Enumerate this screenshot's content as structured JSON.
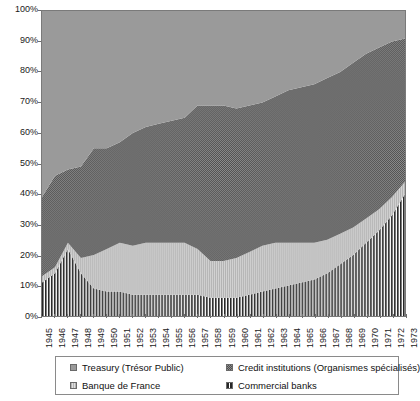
{
  "chart_data": {
    "type": "area",
    "title": "",
    "xlabel": "",
    "ylabel": "",
    "ylim": [
      0,
      100
    ],
    "ytick_labels": [
      "0%",
      "10%",
      "20%",
      "30%",
      "40%",
      "50%",
      "60%",
      "70%",
      "80%",
      "90%",
      "100%"
    ],
    "ytick_values": [
      0,
      10,
      20,
      30,
      40,
      50,
      60,
      70,
      80,
      90,
      100
    ],
    "grid": false,
    "legend_position": "bottom",
    "stacked": true,
    "stack_order_bottom_to_top": [
      "Commercial banks",
      "Banque de France",
      "Credit institutions (Organismes spécialisés)",
      "Treasury (Trésor Public)"
    ],
    "categories": [
      "1945",
      "1946",
      "1947",
      "1948",
      "1949",
      "1950",
      "1951",
      "1952",
      "1953",
      "1954",
      "1955",
      "1956",
      "1957",
      "1958",
      "1959",
      "1960",
      "1961",
      "1962",
      "1963",
      "1964",
      "1965",
      "1966",
      "1967",
      "1968",
      "1969",
      "1970",
      "1971",
      "1972",
      "1973"
    ],
    "series": [
      {
        "name": "Commercial banks",
        "fill": "vertical-stripes",
        "color": "#2a2a2a",
        "values": [
          11,
          14,
          22,
          14,
          9,
          8,
          8,
          7,
          7,
          7,
          7,
          7,
          7,
          6,
          6,
          6,
          7,
          8,
          9,
          10,
          11,
          12,
          14,
          17,
          20,
          24,
          28,
          33,
          40
        ]
      },
      {
        "name": "Banque de France",
        "fill": "light-vertical-hatch",
        "color": "#c9c9c9",
        "values": [
          2,
          2,
          2,
          5,
          11,
          14,
          16,
          16,
          17,
          17,
          17,
          17,
          15,
          12,
          12,
          13,
          14,
          15,
          15,
          14,
          13,
          12,
          11,
          10,
          9,
          8,
          7,
          6,
          4
        ]
      },
      {
        "name": "Credit institutions (Organismes spécialisés)",
        "fill": "checker",
        "color": "#6f6f6f",
        "values": [
          26,
          30,
          24,
          30,
          35,
          33,
          33,
          37,
          38,
          39,
          40,
          41,
          47,
          51,
          51,
          49,
          48,
          47,
          48,
          50,
          51,
          52,
          53,
          53,
          54,
          54,
          53,
          51,
          47
        ]
      },
      {
        "name": "Treasury (Trésor Public)",
        "fill": "solid-gray",
        "color": "#9a9a9a",
        "values": [
          61,
          54,
          52,
          51,
          45,
          45,
          43,
          40,
          38,
          37,
          36,
          35,
          31,
          31,
          31,
          32,
          31,
          30,
          28,
          26,
          25,
          24,
          22,
          20,
          17,
          14,
          12,
          10,
          9
        ]
      }
    ],
    "cumulative_tops_percent": {
      "commercial_banks": [
        11,
        14,
        22,
        14,
        9,
        8,
        8,
        7,
        7,
        7,
        7,
        7,
        7,
        6,
        6,
        6,
        7,
        8,
        9,
        10,
        11,
        12,
        14,
        17,
        20,
        24,
        28,
        33,
        40
      ],
      "banque_de_france": [
        13,
        16,
        24,
        19,
        20,
        22,
        24,
        23,
        24,
        24,
        24,
        24,
        22,
        18,
        18,
        19,
        21,
        23,
        24,
        24,
        24,
        24,
        25,
        27,
        29,
        32,
        35,
        39,
        44
      ],
      "credit_institutions": [
        39,
        46,
        48,
        49,
        55,
        55,
        57,
        60,
        62,
        63,
        64,
        65,
        69,
        69,
        69,
        68,
        69,
        70,
        72,
        74,
        75,
        76,
        78,
        80,
        83,
        86,
        88,
        90,
        91
      ],
      "treasury": [
        100,
        100,
        100,
        100,
        100,
        100,
        100,
        100,
        100,
        100,
        100,
        100,
        100,
        100,
        100,
        100,
        100,
        100,
        100,
        100,
        100,
        100,
        100,
        100,
        100,
        100,
        100,
        100,
        100
      ]
    }
  },
  "legend": {
    "items": [
      {
        "label": "Treasury (Trésor Public)",
        "swatch": "solid-gray"
      },
      {
        "label": "Credit institutions (Organismes spécialisés)",
        "swatch": "checker"
      },
      {
        "label": "Banque de France",
        "swatch": "light-vertical-hatch"
      },
      {
        "label": "Commercial banks",
        "swatch": "vertical-stripes"
      }
    ]
  },
  "colors": {
    "treasury": "#9a9a9a",
    "credit_institutions": "#6f6f6f",
    "banque_de_france": "#c9c9c9",
    "commercial_banks": "#2a2a2a",
    "axis": "#6e6e6e",
    "text": "#111111"
  }
}
